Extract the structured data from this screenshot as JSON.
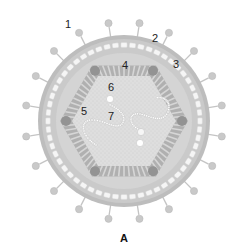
{
  "figure": {
    "caption": "A",
    "labels": [
      {
        "id": "1",
        "text": "1",
        "x": 65,
        "y": 19
      },
      {
        "id": "2",
        "text": "2",
        "x": 152,
        "y": 33
      },
      {
        "id": "3",
        "text": "3",
        "x": 173,
        "y": 59
      },
      {
        "id": "4",
        "text": "4",
        "x": 122,
        "y": 60
      },
      {
        "id": "5",
        "text": "5",
        "x": 81,
        "y": 106
      },
      {
        "id": "6",
        "text": "6",
        "x": 108,
        "y": 82
      },
      {
        "id": "7",
        "text": "7",
        "x": 108,
        "y": 111
      }
    ],
    "colors": {
      "envelope": "#b9b9b9",
      "matrix": "#d6d6d6",
      "membrane_beads": "#f4f4f4",
      "capsid": "#a8a8a8",
      "capsid_vertex": "#8f8f8f",
      "core": "#dcdcdc",
      "spike": "#c4c4c4"
    },
    "structure": {
      "spike_count": 20,
      "center_x": 124,
      "center_y": 121,
      "outer_radius": 86
    }
  }
}
